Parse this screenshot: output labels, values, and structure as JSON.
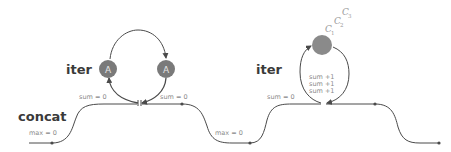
{
  "diagram": {
    "labels": {
      "concat": "concat",
      "iter_left": "iter",
      "iter_right": "iter"
    },
    "annotations": {
      "max_left": "max = 0",
      "sum_left_in": "sum = 0",
      "sum_left_out": "sum = 0",
      "max_middle": "max = 0",
      "sum_right_in": "sum = 0",
      "sum_inc": [
        "sum +1",
        "sum +1",
        "sum +1"
      ]
    },
    "nodes": {
      "left_loop": [
        {
          "label": "A"
        },
        {
          "label": "A"
        }
      ],
      "right_loop": {
        "label": ""
      }
    },
    "stack_labels": [
      {
        "letter": "C",
        "index": "1"
      },
      {
        "letter": "C",
        "index": "2"
      },
      {
        "letter": "C",
        "index": "3"
      }
    ],
    "colors": {
      "line": "#4a4a4a",
      "node_fill": "#7a7a7a",
      "node_text": "#e6e6e6",
      "label_text": "#8a8a8a",
      "title_text": "#3a3a3a"
    }
  }
}
